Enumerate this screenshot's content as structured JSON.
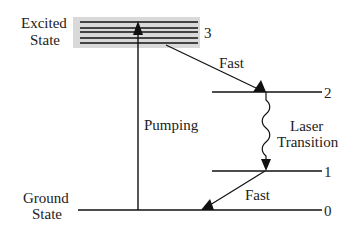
{
  "diagram": {
    "colors": {
      "line": "#111111",
      "band": "#d9d9d9",
      "text": "#222222"
    },
    "labels": {
      "excited_state_line1": "Excited",
      "excited_state_line2": "State",
      "ground_state_line1": "Ground",
      "ground_state_line2": "State",
      "pumping": "Pumping",
      "fast_upper": "Fast",
      "fast_lower": "Fast",
      "laser_line1": "Laser",
      "laser_line2": "Transition"
    },
    "levels": [
      {
        "id": "3",
        "label": "3",
        "name": "Excited State band"
      },
      {
        "id": "2",
        "label": "2",
        "name": "Upper laser level"
      },
      {
        "id": "1",
        "label": "1",
        "name": "Lower laser level"
      },
      {
        "id": "0",
        "label": "0",
        "name": "Ground State"
      }
    ],
    "transitions": [
      {
        "from": "0",
        "to": "3",
        "label": "Pumping",
        "style": "straight"
      },
      {
        "from": "3",
        "to": "2",
        "label": "Fast",
        "style": "straight"
      },
      {
        "from": "2",
        "to": "1",
        "label": "Laser Transition",
        "style": "wavy"
      },
      {
        "from": "1",
        "to": "0",
        "label": "Fast",
        "style": "straight"
      }
    ]
  }
}
